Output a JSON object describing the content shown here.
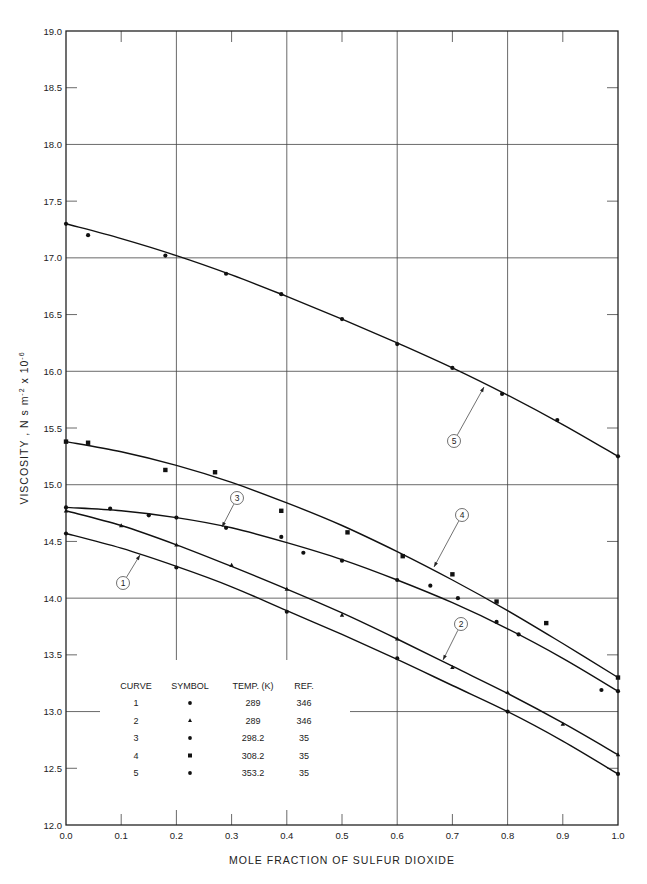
{
  "chart_data": {
    "type": "line",
    "title": "",
    "xlabel": "MOLE FRACTION OF SULFUR DIOXIDE",
    "ylabel": "VISCOSITY , N s m^-2 x 10^-6",
    "xlim": [
      0.0,
      1.0
    ],
    "ylim": [
      12.0,
      19.0
    ],
    "x_ticks": [
      "0.0",
      "0.1",
      "0.2",
      "0.3",
      "0.4",
      "0.5",
      "0.6",
      "0.7",
      "0.8",
      "0.9",
      "1.0"
    ],
    "y_ticks": [
      "12.0",
      "12.5",
      "13.0",
      "13.5",
      "14.0",
      "14.5",
      "15.0",
      "15.5",
      "16.0",
      "16.5",
      "17.0",
      "17.5",
      "18.0",
      "18.5",
      "19.0"
    ],
    "grid": true,
    "legend_position": "lower-left inside",
    "legend_headers": [
      "CURVE",
      "SYMBOL",
      "TEMP. (K)",
      "REF."
    ],
    "series": [
      {
        "name": "1",
        "curve": "1",
        "symbol": "circle-dot",
        "temp_K": "289",
        "ref": "346",
        "x": [
          0.0,
          0.2,
          0.4,
          0.6,
          0.8,
          1.0
        ],
        "y": [
          14.57,
          14.27,
          13.88,
          13.47,
          13.0,
          12.45
        ],
        "fit": [
          [
            0,
            14.57
          ],
          [
            0.1,
            14.44
          ],
          [
            0.2,
            14.28
          ],
          [
            0.3,
            14.1
          ],
          [
            0.4,
            13.89
          ],
          [
            0.5,
            13.68
          ],
          [
            0.6,
            13.46
          ],
          [
            0.7,
            13.23
          ],
          [
            0.8,
            13.0
          ],
          [
            0.9,
            12.74
          ],
          [
            1.0,
            12.45
          ]
        ],
        "callout": {
          "label": "1",
          "cx": 123,
          "cy": 583,
          "tx": 140,
          "ty": 555
        }
      },
      {
        "name": "2",
        "curve": "2",
        "symbol": "triangle",
        "temp_K": "289",
        "ref": "346",
        "x": [
          0.0,
          0.1,
          0.2,
          0.3,
          0.4,
          0.5,
          0.6,
          0.7,
          0.8,
          0.9,
          1.0
        ],
        "y": [
          14.77,
          14.64,
          14.47,
          14.29,
          14.08,
          13.85,
          13.64,
          13.39,
          13.17,
          12.89,
          12.62
        ],
        "fit": [
          [
            0,
            14.77
          ],
          [
            0.1,
            14.64
          ],
          [
            0.2,
            14.47
          ],
          [
            0.3,
            14.28
          ],
          [
            0.4,
            14.08
          ],
          [
            0.5,
            13.87
          ],
          [
            0.6,
            13.64
          ],
          [
            0.7,
            13.4
          ],
          [
            0.8,
            13.16
          ],
          [
            0.9,
            12.9
          ],
          [
            1.0,
            12.62
          ]
        ],
        "callout": {
          "label": "2",
          "cx": 461,
          "cy": 624,
          "tx": 443,
          "ty": 660
        }
      },
      {
        "name": "3",
        "curve": "3",
        "symbol": "dot",
        "temp_K": "298.2",
        "ref": "35",
        "x": [
          0.0,
          0.08,
          0.15,
          0.2,
          0.29,
          0.39,
          0.43,
          0.5,
          0.6,
          0.66,
          0.71,
          0.78,
          0.82,
          0.97,
          1.0
        ],
        "y": [
          14.8,
          14.79,
          14.73,
          14.71,
          14.62,
          14.54,
          14.4,
          14.33,
          14.16,
          14.11,
          14.0,
          13.79,
          13.68,
          13.19,
          13.18
        ],
        "fit": [
          [
            0,
            14.8
          ],
          [
            0.1,
            14.77
          ],
          [
            0.2,
            14.71
          ],
          [
            0.3,
            14.62
          ],
          [
            0.4,
            14.49
          ],
          [
            0.5,
            14.34
          ],
          [
            0.6,
            14.16
          ],
          [
            0.7,
            13.96
          ],
          [
            0.8,
            13.73
          ],
          [
            0.9,
            13.47
          ],
          [
            1.0,
            13.18
          ]
        ],
        "callout": {
          "label": "3",
          "cx": 237,
          "cy": 498,
          "tx": 222,
          "ty": 527
        }
      },
      {
        "name": "4",
        "curve": "4",
        "symbol": "square",
        "temp_K": "308.2",
        "ref": "35",
        "x": [
          0.0,
          0.04,
          0.18,
          0.27,
          0.39,
          0.51,
          0.61,
          0.7,
          0.78,
          0.87,
          1.0
        ],
        "y": [
          15.38,
          15.37,
          15.13,
          15.11,
          14.77,
          14.58,
          14.37,
          14.21,
          13.97,
          13.78,
          13.3
        ],
        "fit": [
          [
            0,
            15.38
          ],
          [
            0.1,
            15.29
          ],
          [
            0.2,
            15.17
          ],
          [
            0.3,
            15.02
          ],
          [
            0.4,
            14.84
          ],
          [
            0.5,
            14.64
          ],
          [
            0.6,
            14.41
          ],
          [
            0.7,
            14.16
          ],
          [
            0.8,
            13.89
          ],
          [
            0.9,
            13.6
          ],
          [
            1.0,
            13.3
          ]
        ],
        "callout": {
          "label": "4",
          "cx": 462,
          "cy": 515,
          "tx": 434,
          "ty": 567
        }
      },
      {
        "name": "5",
        "curve": "5",
        "symbol": "dot",
        "temp_K": "353.2",
        "ref": "35",
        "x": [
          0.0,
          0.04,
          0.18,
          0.29,
          0.39,
          0.5,
          0.6,
          0.7,
          0.79,
          0.89,
          1.0
        ],
        "y": [
          17.3,
          17.2,
          17.02,
          16.86,
          16.68,
          16.46,
          16.24,
          16.03,
          15.8,
          15.57,
          15.25
        ],
        "fit": [
          [
            0,
            17.3
          ],
          [
            0.1,
            17.17
          ],
          [
            0.2,
            17.02
          ],
          [
            0.3,
            16.85
          ],
          [
            0.4,
            16.66
          ],
          [
            0.5,
            16.46
          ],
          [
            0.6,
            16.25
          ],
          [
            0.7,
            16.03
          ],
          [
            0.8,
            15.79
          ],
          [
            0.9,
            15.53
          ],
          [
            1.0,
            15.25
          ]
        ],
        "callout": {
          "label": "5",
          "cx": 454,
          "cy": 441,
          "tx": 484,
          "ty": 387
        }
      }
    ]
  },
  "axes": {
    "x_title": "MOLE FRACTION OF SULFUR DIOXIDE",
    "y_title_main": "VISCOSITY ,  N s m",
    "y_title_exp1": "-2",
    "y_title_mid": " x 10",
    "y_title_exp2": "-6"
  },
  "legend": {
    "headers": [
      "CURVE",
      "SYMBOL",
      "TEMP. (K)",
      "REF."
    ],
    "rows": [
      {
        "curve": "1",
        "symbol": "•",
        "temp": "289",
        "ref": "346"
      },
      {
        "curve": "2",
        "symbol": "▴",
        "temp": "289",
        "ref": "346"
      },
      {
        "curve": "3",
        "symbol": "•",
        "temp": "298.2",
        "ref": "35"
      },
      {
        "curve": "4",
        "symbol": "▪",
        "temp": "308.2",
        "ref": "35"
      },
      {
        "curve": "5",
        "symbol": "•",
        "temp": "353.2",
        "ref": "35"
      }
    ]
  }
}
